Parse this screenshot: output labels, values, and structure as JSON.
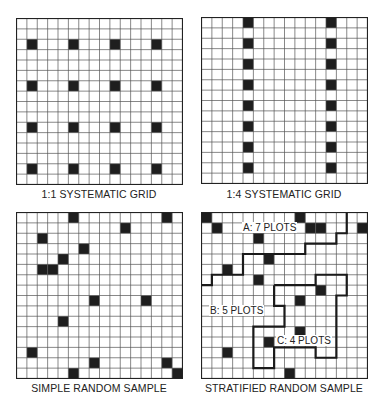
{
  "figure": {
    "grid_size": 16,
    "colors": {
      "background": "#ffffff",
      "grid_line": "#555555",
      "border": "#222222",
      "plot_fill": "#1e1e1e",
      "stratum_line": "#1a1a1a",
      "text": "#222222"
    },
    "panels": [
      {
        "id": "systematic-1-1",
        "caption": "1:1 SYSTEMATIC GRID",
        "plots": [
          [
            1,
            2
          ],
          [
            5,
            2
          ],
          [
            9,
            2
          ],
          [
            13,
            2
          ],
          [
            1,
            6
          ],
          [
            5,
            6
          ],
          [
            9,
            6
          ],
          [
            13,
            6
          ],
          [
            1,
            10
          ],
          [
            5,
            10
          ],
          [
            9,
            10
          ],
          [
            13,
            10
          ],
          [
            1,
            14
          ],
          [
            5,
            14
          ],
          [
            9,
            14
          ],
          [
            13,
            14
          ]
        ]
      },
      {
        "id": "systematic-1-4",
        "caption": "1:4 SYSTEMATIC GRID",
        "plots": [
          [
            4,
            0
          ],
          [
            12,
            0
          ],
          [
            4,
            2
          ],
          [
            12,
            2
          ],
          [
            4,
            4
          ],
          [
            12,
            4
          ],
          [
            4,
            6
          ],
          [
            12,
            6
          ],
          [
            4,
            8
          ],
          [
            12,
            8
          ],
          [
            4,
            10
          ],
          [
            12,
            10
          ],
          [
            4,
            12
          ],
          [
            12,
            12
          ],
          [
            4,
            14
          ],
          [
            12,
            14
          ]
        ]
      },
      {
        "id": "simple-random",
        "caption": "SIMPLE RANDOM SAMPLE",
        "plots": [
          [
            5,
            0
          ],
          [
            14,
            0
          ],
          [
            10,
            1
          ],
          [
            2,
            2
          ],
          [
            6,
            3
          ],
          [
            4,
            4
          ],
          [
            2,
            5
          ],
          [
            3,
            5
          ],
          [
            7,
            8
          ],
          [
            12,
            8
          ],
          [
            4,
            10
          ],
          [
            1,
            13
          ],
          [
            7,
            14
          ],
          [
            14,
            14
          ],
          [
            5,
            15
          ],
          [
            15,
            15
          ]
        ]
      },
      {
        "id": "stratified-random",
        "caption": "STRATIFIED RANDOM SAMPLE",
        "plots": [
          [
            0,
            0
          ],
          [
            9,
            0
          ],
          [
            1,
            1
          ],
          [
            10,
            1
          ],
          [
            11,
            1
          ],
          [
            15,
            1
          ],
          [
            5,
            2
          ],
          [
            6,
            4
          ],
          [
            2,
            5
          ],
          [
            5,
            6
          ],
          [
            11,
            7
          ],
          [
            9,
            8
          ],
          [
            9,
            11
          ],
          [
            6,
            12
          ],
          [
            2,
            13
          ],
          [
            8,
            15
          ]
        ],
        "strata": [
          {
            "name": "A",
            "label": "A:  7 PLOTS",
            "plot_count": 7
          },
          {
            "name": "B",
            "label": "B:  5 PLOTS",
            "plot_count": 5
          },
          {
            "name": "C",
            "label": "C:  4 PLOTS",
            "plot_count": 4
          }
        ],
        "boundaries": [
          [
            [
              0,
              7
            ],
            [
              1,
              7
            ],
            [
              1,
              6
            ],
            [
              4,
              6
            ],
            [
              4,
              4
            ],
            [
              10,
              4
            ],
            [
              10,
              3
            ],
            [
              13,
              3
            ],
            [
              13,
              2
            ],
            [
              14,
              2
            ],
            [
              14,
              0
            ]
          ],
          [
            [
              7,
              7
            ],
            [
              11,
              7
            ],
            [
              11,
              6
            ],
            [
              14,
              6
            ],
            [
              14,
              8
            ],
            [
              13,
              8
            ],
            [
              13,
              14
            ],
            [
              11,
              14
            ],
            [
              11,
              13
            ],
            [
              7,
              13
            ],
            [
              7,
              15
            ],
            [
              5,
              15
            ],
            [
              5,
              11
            ],
            [
              8,
              11
            ],
            [
              8,
              9
            ],
            [
              7,
              9
            ],
            [
              7,
              7
            ]
          ]
        ]
      }
    ]
  }
}
